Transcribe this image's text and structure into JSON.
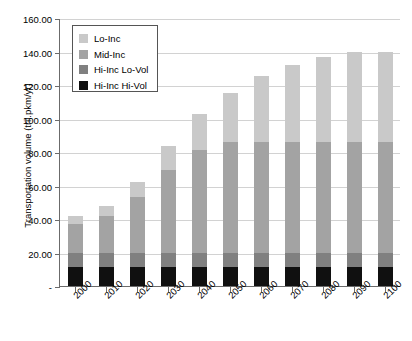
{
  "chart_data": {
    "type": "bar",
    "subtype": "stacked-column",
    "title": "",
    "xlabel": "",
    "ylabel": "Transportation volume (tril.pkm/yr)",
    "ylim": [
      0,
      160
    ],
    "ytick_step": 20,
    "ytick_labels": [
      "160.00",
      "140.00",
      "120.00",
      "100.00",
      "80.00",
      "60.00",
      "40.00",
      "20.00",
      "-"
    ],
    "ytick_values": [
      160,
      140,
      120,
      100,
      80,
      60,
      40,
      20,
      0
    ],
    "grid": "horizontal",
    "legend_position": "top-left-inside",
    "categories": [
      "2000",
      "2010",
      "2020",
      "2030",
      "2040",
      "2050",
      "2060",
      "2070",
      "2080",
      "2090",
      "2100"
    ],
    "series": [
      {
        "name": "Hi-Inc Hi-Vol",
        "color": "#101010",
        "values": [
          11.5,
          11.5,
          11.5,
          11.5,
          11.5,
          11.5,
          11.5,
          11.5,
          11.5,
          11.5,
          11.5
        ]
      },
      {
        "name": "Hi-Inc Lo-Vol",
        "color": "#808080",
        "values": [
          8.5,
          8.5,
          8.5,
          8.5,
          8.5,
          8.5,
          8.5,
          8.5,
          8.5,
          8.5,
          8.5
        ]
      },
      {
        "name": "Mid-Inc",
        "color": "#a3a3a3",
        "values": [
          17.0,
          22.0,
          33.0,
          49.0,
          61.0,
          66.0,
          66.0,
          66.0,
          66.0,
          66.0,
          66.0
        ]
      },
      {
        "name": "Lo-Inc",
        "color": "#c9c9c9",
        "values": [
          5.0,
          6.0,
          9.0,
          14.5,
          22.0,
          29.5,
          39.5,
          46.0,
          51.0,
          54.0,
          54.0
        ]
      }
    ],
    "totals": [
      42,
      48,
      62,
      83.5,
      103,
      115.5,
      125.5,
      132,
      137,
      140,
      140
    ],
    "legend_entries": [
      "Lo-Inc",
      "Mid-Inc",
      "Hi-Inc Lo-Vol",
      "Hi-Inc Hi-Vol"
    ]
  }
}
